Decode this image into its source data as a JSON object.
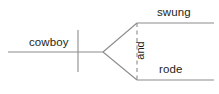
{
  "diagram": {
    "type": "branching-sentence-diagram",
    "background_color": "#ffffff",
    "line_color": "#8c8c8c",
    "text_color": "#231f20",
    "subject": {
      "label": "cowboy"
    },
    "conjunction": {
      "label": "and",
      "rotation_degrees": -90,
      "line_style": "dashed"
    },
    "branches": [
      {
        "label": "swung",
        "position": "upper"
      },
      {
        "label": "rode",
        "position": "lower"
      }
    ]
  }
}
